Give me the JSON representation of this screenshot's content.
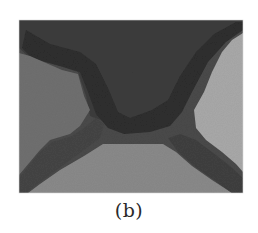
{
  "figure": {
    "caption": "(b)",
    "panel": {
      "description": "grayscale segmented region image",
      "colors": {
        "background": "#ffffff",
        "top_region": "#3c3c3c",
        "dark_band": "#2c2c2c",
        "mid_band": "#4a4a4a",
        "left_region": "#707070",
        "bottom_region": "#8a8a8a",
        "right_region": "#a9a9a9"
      }
    }
  }
}
